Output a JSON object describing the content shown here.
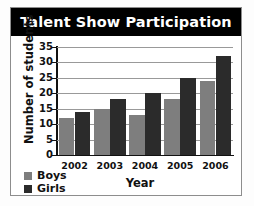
{
  "chart_data": {
    "type": "bar",
    "title": "Talent Show Participation",
    "xlabel": "Year",
    "ylabel": "Number of students",
    "categories": [
      "2002",
      "2003",
      "2004",
      "2005",
      "2006"
    ],
    "series": [
      {
        "name": "Boys",
        "color": "#7e7e7e",
        "values": [
          12,
          15,
          13,
          18,
          24
        ]
      },
      {
        "name": "Girls",
        "color": "#2b2b2b",
        "values": [
          14,
          18,
          20,
          25,
          32
        ]
      }
    ],
    "ylim": [
      0,
      35
    ],
    "yticks": [
      0,
      5,
      10,
      15,
      20,
      25,
      30,
      35
    ],
    "ytick_labels": [
      "0",
      "5",
      "10",
      "15",
      "20",
      "25",
      "30",
      "35"
    ],
    "grid": true,
    "legend_position": "bottom-left",
    "title_style": {
      "background": "#000000",
      "text_color": "#ffffff"
    }
  }
}
